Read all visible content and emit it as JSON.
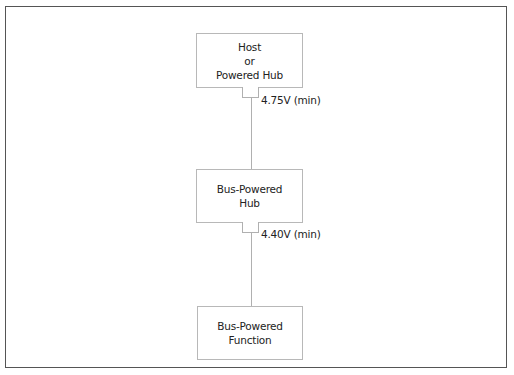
{
  "diagram": {
    "type": "usb-power-topology",
    "nodes": [
      {
        "id": "host",
        "lines": [
          "Host",
          "or",
          "Powered Hub"
        ]
      },
      {
        "id": "bus-hub",
        "lines": [
          "Bus-Powered",
          "Hub"
        ]
      },
      {
        "id": "bus-function",
        "lines": [
          "Bus-Powered",
          "Function"
        ]
      }
    ],
    "edges": [
      {
        "from": "host",
        "to": "bus-hub",
        "label": "4.75V (min)"
      },
      {
        "from": "bus-hub",
        "to": "bus-function",
        "label": "4.40V (min)"
      }
    ]
  },
  "colors": {
    "frame": "#555555",
    "box_border": "#b8b8b8",
    "line": "#b0b0b0",
    "text": "#222222"
  }
}
